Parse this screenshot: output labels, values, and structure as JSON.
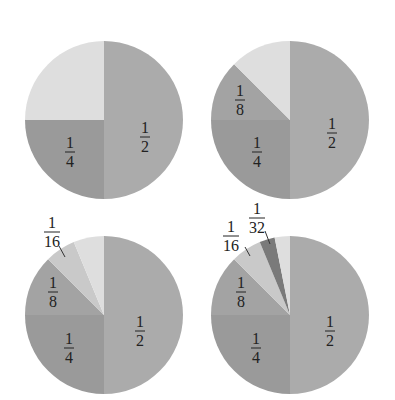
{
  "colors": {
    "half": "#ababab",
    "quarter": "#9a9a9a",
    "eighth": "#a3a3a3",
    "sixteenth": "#c9c9c9",
    "thirtysecond": "#7a7a7a",
    "remainder": "#dedede",
    "leader": "#333333"
  },
  "chart_data": [
    {
      "type": "pie",
      "position": "top-left",
      "center": [
        104,
        120
      ],
      "radius": 79,
      "slices": [
        {
          "label_num": "1",
          "label_den": "2",
          "value": 0.5,
          "color_key": "half",
          "label_pos": [
            145,
            137
          ]
        },
        {
          "label_num": "1",
          "label_den": "4",
          "value": 0.25,
          "color_key": "quarter",
          "label_pos": [
            70,
            152
          ]
        },
        {
          "label_num": "",
          "label_den": "",
          "value": 0.25,
          "color_key": "remainder"
        }
      ]
    },
    {
      "type": "pie",
      "position": "top-right",
      "center": [
        290,
        120
      ],
      "radius": 79,
      "slices": [
        {
          "label_num": "1",
          "label_den": "2",
          "value": 0.5,
          "color_key": "half",
          "label_pos": [
            332,
            133
          ]
        },
        {
          "label_num": "1",
          "label_den": "4",
          "value": 0.25,
          "color_key": "quarter",
          "label_pos": [
            257,
            152
          ]
        },
        {
          "label_num": "1",
          "label_den": "8",
          "value": 0.125,
          "color_key": "eighth",
          "label_pos": [
            240,
            100
          ]
        },
        {
          "label_num": "",
          "label_den": "",
          "value": 0.125,
          "color_key": "remainder"
        }
      ]
    },
    {
      "type": "pie",
      "position": "bottom-left",
      "center": [
        104,
        315
      ],
      "radius": 79,
      "slices": [
        {
          "label_num": "1",
          "label_den": "2",
          "value": 0.5,
          "color_key": "half",
          "label_pos": [
            140,
            331
          ]
        },
        {
          "label_num": "1",
          "label_den": "4",
          "value": 0.25,
          "color_key": "quarter",
          "label_pos": [
            69,
            348
          ]
        },
        {
          "label_num": "1",
          "label_den": "8",
          "value": 0.125,
          "color_key": "eighth",
          "label_pos": [
            53,
            292
          ]
        },
        {
          "label_num": "1",
          "label_den": "16",
          "value": 0.0625,
          "color_key": "sixteenth",
          "label_pos": [
            52,
            232
          ],
          "leader": [
            [
              59,
              246
            ],
            [
              65,
              257
            ]
          ]
        },
        {
          "label_num": "",
          "label_den": "",
          "value": 0.0625,
          "color_key": "remainder"
        }
      ]
    },
    {
      "type": "pie",
      "position": "bottom-right",
      "center": [
        290,
        315
      ],
      "radius": 79,
      "slices": [
        {
          "label_num": "1",
          "label_den": "2",
          "value": 0.5,
          "color_key": "half",
          "label_pos": [
            330,
            331
          ]
        },
        {
          "label_num": "1",
          "label_den": "4",
          "value": 0.25,
          "color_key": "quarter",
          "label_pos": [
            256,
            348
          ]
        },
        {
          "label_num": "1",
          "label_den": "8",
          "value": 0.125,
          "color_key": "eighth",
          "label_pos": [
            241,
            292
          ]
        },
        {
          "label_num": "1",
          "label_den": "16",
          "value": 0.0625,
          "color_key": "sixteenth",
          "label_pos": [
            231,
            236
          ],
          "leader": [
            [
              245,
              247
            ],
            [
              250,
              256
            ]
          ]
        },
        {
          "label_num": "1",
          "label_den": "32",
          "value": 0.03125,
          "color_key": "thirtysecond",
          "label_pos": [
            257,
            218
          ],
          "leader": [
            [
              265,
              231
            ],
            [
              270,
              244
            ]
          ]
        },
        {
          "label_num": "",
          "label_den": "",
          "value": 0.03125,
          "color_key": "remainder"
        }
      ]
    }
  ]
}
